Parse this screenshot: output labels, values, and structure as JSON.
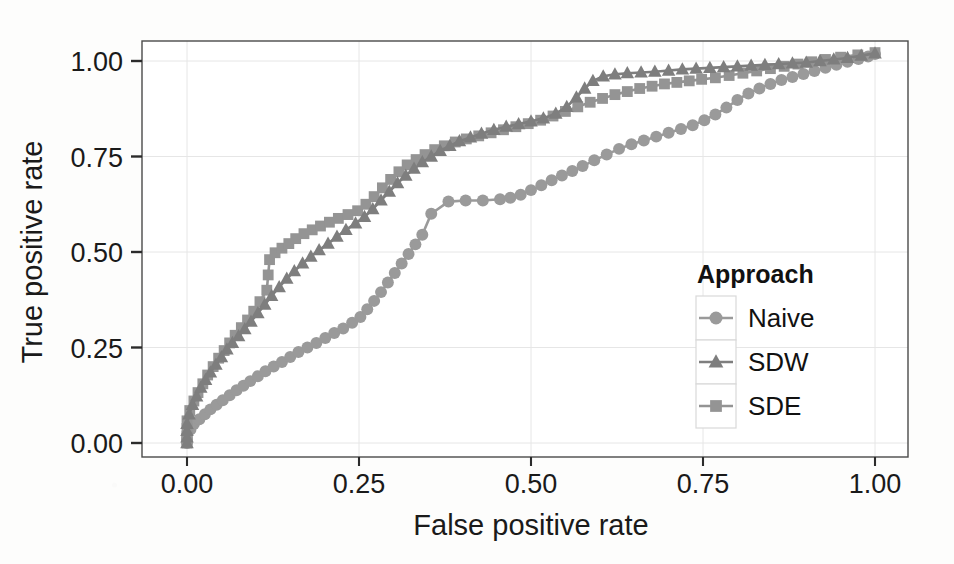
{
  "chart_data": {
    "type": "line",
    "title": "",
    "xlabel": "False positive rate",
    "ylabel": "True positive rate",
    "xlim": [
      0.0,
      1.0
    ],
    "ylim": [
      0.0,
      1.0
    ],
    "xticks": [
      "0.00",
      "0.25",
      "0.50",
      "0.75",
      "1.00"
    ],
    "xtick_values": [
      0.0,
      0.25,
      0.5,
      0.75,
      1.0
    ],
    "yticks": [
      "0.00",
      "0.25",
      "0.50",
      "0.75",
      "1.00"
    ],
    "ytick_values": [
      0.0,
      0.25,
      0.5,
      0.75,
      1.0
    ],
    "grid": true,
    "legend": {
      "title": "Approach",
      "position": "right-inside",
      "entries": [
        {
          "name": "Naive",
          "marker": "circle",
          "color": "#9a9a9a"
        },
        {
          "name": "SDW",
          "marker": "triangle",
          "color": "#7e7e7e"
        },
        {
          "name": "SDE",
          "marker": "square",
          "color": "#949494"
        }
      ]
    },
    "series": [
      {
        "name": "Naive",
        "marker": "circle",
        "color": "#9a9a9a",
        "x": [
          0.0,
          0.0,
          0.0,
          0.005,
          0.01,
          0.018,
          0.026,
          0.034,
          0.043,
          0.052,
          0.062,
          0.072,
          0.082,
          0.092,
          0.103,
          0.114,
          0.126,
          0.138,
          0.15,
          0.162,
          0.175,
          0.188,
          0.201,
          0.214,
          0.227,
          0.24,
          0.252,
          0.262,
          0.272,
          0.282,
          0.292,
          0.302,
          0.312,
          0.322,
          0.332,
          0.342,
          0.355,
          0.38,
          0.405,
          0.43,
          0.455,
          0.47,
          0.485,
          0.5,
          0.515,
          0.53,
          0.545,
          0.56,
          0.575,
          0.592,
          0.61,
          0.628,
          0.646,
          0.664,
          0.682,
          0.7,
          0.718,
          0.735,
          0.752,
          0.768,
          0.784,
          0.8,
          0.816,
          0.832,
          0.848,
          0.864,
          0.88,
          0.896,
          0.912,
          0.928,
          0.944,
          0.96,
          0.976,
          0.99,
          1.0
        ],
        "y": [
          0.0,
          0.01,
          0.02,
          0.035,
          0.05,
          0.062,
          0.075,
          0.088,
          0.1,
          0.112,
          0.125,
          0.138,
          0.15,
          0.162,
          0.175,
          0.188,
          0.2,
          0.212,
          0.225,
          0.238,
          0.25,
          0.262,
          0.275,
          0.288,
          0.3,
          0.315,
          0.33,
          0.35,
          0.372,
          0.395,
          0.42,
          0.445,
          0.47,
          0.495,
          0.52,
          0.545,
          0.6,
          0.632,
          0.635,
          0.635,
          0.638,
          0.642,
          0.65,
          0.662,
          0.675,
          0.688,
          0.7,
          0.712,
          0.725,
          0.74,
          0.755,
          0.77,
          0.782,
          0.792,
          0.802,
          0.812,
          0.822,
          0.832,
          0.845,
          0.86,
          0.878,
          0.898,
          0.915,
          0.928,
          0.94,
          0.95,
          0.958,
          0.966,
          0.974,
          0.982,
          0.99,
          0.998,
          1.005,
          1.012,
          1.018
        ]
      },
      {
        "name": "SDW",
        "marker": "triangle",
        "color": "#7e7e7e",
        "x": [
          0.0,
          0.0,
          0.0,
          0.0,
          0.003,
          0.008,
          0.014,
          0.02,
          0.027,
          0.034,
          0.042,
          0.05,
          0.058,
          0.066,
          0.075,
          0.084,
          0.093,
          0.103,
          0.113,
          0.123,
          0.134,
          0.145,
          0.156,
          0.168,
          0.18,
          0.192,
          0.205,
          0.218,
          0.231,
          0.245,
          0.258,
          0.27,
          0.282,
          0.294,
          0.306,
          0.318,
          0.33,
          0.342,
          0.355,
          0.368,
          0.382,
          0.396,
          0.412,
          0.428,
          0.446,
          0.464,
          0.482,
          0.5,
          0.518,
          0.536,
          0.552,
          0.566,
          0.578,
          0.59,
          0.605,
          0.622,
          0.64,
          0.66,
          0.68,
          0.7,
          0.72,
          0.74,
          0.76,
          0.78,
          0.8,
          0.82,
          0.84,
          0.86,
          0.88,
          0.9,
          0.92,
          0.94,
          0.96,
          0.98,
          1.0
        ],
        "y": [
          0.0,
          0.015,
          0.032,
          0.05,
          0.075,
          0.1,
          0.122,
          0.145,
          0.165,
          0.185,
          0.205,
          0.225,
          0.245,
          0.262,
          0.28,
          0.298,
          0.318,
          0.34,
          0.362,
          0.385,
          0.408,
          0.43,
          0.45,
          0.47,
          0.488,
          0.505,
          0.522,
          0.54,
          0.558,
          0.575,
          0.592,
          0.612,
          0.635,
          0.658,
          0.68,
          0.7,
          0.718,
          0.735,
          0.75,
          0.765,
          0.778,
          0.79,
          0.8,
          0.81,
          0.82,
          0.828,
          0.835,
          0.842,
          0.85,
          0.862,
          0.88,
          0.905,
          0.928,
          0.948,
          0.96,
          0.965,
          0.968,
          0.97,
          0.972,
          0.975,
          0.978,
          0.98,
          0.982,
          0.984,
          0.986,
          0.988,
          0.99,
          0.992,
          0.994,
          0.996,
          1.0,
          1.004,
          1.008,
          1.014,
          1.02
        ]
      },
      {
        "name": "SDE",
        "marker": "square",
        "color": "#949494",
        "x": [
          0.0,
          0.0,
          0.0,
          0.0,
          0.004,
          0.01,
          0.016,
          0.023,
          0.03,
          0.038,
          0.046,
          0.054,
          0.062,
          0.07,
          0.079,
          0.088,
          0.097,
          0.106,
          0.116,
          0.118,
          0.12,
          0.128,
          0.138,
          0.148,
          0.158,
          0.17,
          0.182,
          0.194,
          0.207,
          0.22,
          0.234,
          0.248,
          0.26,
          0.272,
          0.284,
          0.296,
          0.308,
          0.32,
          0.333,
          0.346,
          0.36,
          0.374,
          0.39,
          0.406,
          0.424,
          0.442,
          0.46,
          0.478,
          0.496,
          0.514,
          0.532,
          0.55,
          0.568,
          0.586,
          0.604,
          0.622,
          0.64,
          0.658,
          0.676,
          0.694,
          0.712,
          0.73,
          0.748,
          0.768,
          0.788,
          0.808,
          0.828,
          0.848,
          0.868,
          0.888,
          0.908,
          0.928,
          0.95,
          0.975,
          1.0
        ],
        "y": [
          0.0,
          0.018,
          0.038,
          0.058,
          0.085,
          0.11,
          0.132,
          0.155,
          0.178,
          0.2,
          0.222,
          0.242,
          0.262,
          0.282,
          0.302,
          0.322,
          0.345,
          0.37,
          0.4,
          0.44,
          0.48,
          0.498,
          0.51,
          0.522,
          0.535,
          0.548,
          0.558,
          0.568,
          0.578,
          0.588,
          0.598,
          0.608,
          0.625,
          0.645,
          0.668,
          0.69,
          0.71,
          0.728,
          0.742,
          0.755,
          0.768,
          0.778,
          0.788,
          0.796,
          0.804,
          0.812,
          0.82,
          0.828,
          0.836,
          0.845,
          0.856,
          0.868,
          0.88,
          0.892,
          0.902,
          0.912,
          0.92,
          0.928,
          0.934,
          0.94,
          0.944,
          0.948,
          0.952,
          0.956,
          0.962,
          0.968,
          0.974,
          0.98,
          0.986,
          0.992,
          0.998,
          1.004,
          1.01,
          1.016,
          1.022
        ]
      }
    ]
  },
  "axes": {
    "x_label": "False positive rate",
    "y_label": "True positive rate"
  },
  "style": {
    "panel_background": "#ffffff",
    "panel_border": "#4a4a4a",
    "grid_color": "#e6e6e6",
    "tick_color": "#2b2b2b",
    "text_color": "#1a1a1a",
    "naive_color": "#9a9a9a",
    "sdw_color": "#7e7e7e",
    "sde_color": "#949494"
  }
}
